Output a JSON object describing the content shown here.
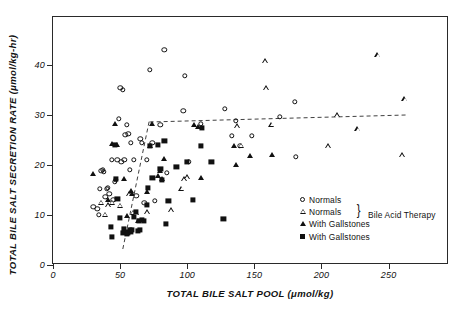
{
  "chart_data": {
    "type": "scatter",
    "title": "",
    "xlabel": "TOTAL BILE SALT POOL (μmol/kg)",
    "ylabel": "TOTAL BILE SALT SECRETION RATE (μmol/kg-hr)",
    "xlim": [
      0,
      295
    ],
    "ylim": [
      0,
      49.6
    ],
    "xticks": [
      0,
      50,
      100,
      150,
      200,
      250
    ],
    "yticks": [
      0,
      10,
      20,
      30,
      40
    ],
    "grid": false,
    "legend_position": "lower-right-inside",
    "legend": [
      {
        "marker": "open-circle",
        "label": "Normals"
      },
      {
        "marker": "open-triangle",
        "label": "Normals"
      },
      {
        "marker": "filled-triangle",
        "label": "With Gallstones"
      },
      {
        "marker": "filled-square",
        "label": "With Gallstones"
      }
    ],
    "annotations": [
      {
        "text": "Bile Acid Therapy",
        "brace_spans": [
          "open-triangle",
          "filled-triangle"
        ]
      }
    ],
    "fit_lines": [
      {
        "name": "steep-rising-dashed",
        "style": "dashed",
        "x": [
          52,
          72
        ],
        "y": [
          3.2,
          29.2
        ]
      },
      {
        "name": "plateau-dashed",
        "style": "dashed",
        "x": [
          72,
          263
        ],
        "y": [
          28.6,
          30.0
        ]
      }
    ],
    "series": [
      {
        "name": "Normals",
        "marker": "open-circle",
        "points": [
          [
            30,
            11.6
          ],
          [
            33,
            11.3
          ],
          [
            34,
            10.0
          ],
          [
            35,
            15.2
          ],
          [
            36,
            18.8
          ],
          [
            37,
            19.0
          ],
          [
            38,
            18.6
          ],
          [
            39,
            13.6
          ],
          [
            40,
            15.3
          ],
          [
            41,
            15.5
          ],
          [
            42,
            14.2
          ],
          [
            44,
            21.0
          ],
          [
            45,
            13.0
          ],
          [
            46,
            16.6
          ],
          [
            47,
            17.0
          ],
          [
            48,
            21.0
          ],
          [
            49,
            29.2
          ],
          [
            50,
            35.4
          ],
          [
            51,
            20.7
          ],
          [
            52,
            35.0
          ],
          [
            53,
            21.0
          ],
          [
            54,
            26.0
          ],
          [
            55,
            28.0
          ],
          [
            56,
            26.2
          ],
          [
            57,
            19.0
          ],
          [
            58,
            24.5
          ],
          [
            60,
            21.0
          ],
          [
            62,
            13.9
          ],
          [
            65,
            25.3
          ],
          [
            66,
            24.5
          ],
          [
            68,
            12.4
          ],
          [
            70,
            21.0
          ],
          [
            72,
            39.0
          ],
          [
            74,
            24.4
          ],
          [
            76,
            12.9
          ],
          [
            80,
            28.0
          ],
          [
            83,
            43.0
          ],
          [
            85,
            18.5
          ],
          [
            97,
            30.8
          ],
          [
            98,
            37.8
          ],
          [
            101,
            20.6
          ],
          [
            110,
            28.2
          ],
          [
            128,
            31.3
          ],
          [
            133,
            25.8
          ],
          [
            136,
            28.8
          ],
          [
            139,
            23.9
          ],
          [
            148,
            25.8
          ],
          [
            169,
            29.7
          ],
          [
            180,
            32.6
          ],
          [
            181,
            21.6
          ]
        ]
      },
      {
        "name": "Normals (Bile Acid Therapy)",
        "marker": "open-triangle",
        "points": [
          [
            36,
            12.5
          ],
          [
            39,
            10.1
          ],
          [
            41,
            12.0
          ],
          [
            44,
            12.5
          ],
          [
            50,
            11.9
          ],
          [
            57,
            14.2
          ],
          [
            60,
            10.5
          ],
          [
            62,
            10.4
          ],
          [
            70,
            10.6
          ],
          [
            88,
            11.0
          ],
          [
            96,
            15.3
          ],
          [
            98,
            17.2
          ],
          [
            100,
            17.6
          ],
          [
            137,
            27.8
          ],
          [
            140,
            23.9
          ],
          [
            158,
            40.8
          ],
          [
            159,
            35.4
          ],
          [
            163,
            28.1
          ],
          [
            205,
            23.8
          ],
          [
            212,
            30.0
          ],
          [
            227,
            27.2
          ],
          [
            242,
            42.0
          ],
          [
            260,
            22.0
          ],
          [
            262,
            33.2
          ]
        ]
      },
      {
        "name": "With Gallstones (Bile Acid Therapy)",
        "marker": "filled-triangle",
        "points": [
          [
            30,
            18.2
          ],
          [
            41,
            13.0
          ],
          [
            44,
            24.2
          ],
          [
            46,
            28.2
          ],
          [
            48,
            24.0
          ],
          [
            53,
            17.3
          ],
          [
            55,
            9.8
          ],
          [
            57,
            6.6
          ],
          [
            58,
            14.9
          ],
          [
            59,
            14.2
          ],
          [
            63,
            8.9
          ],
          [
            70,
            14.7
          ],
          [
            72,
            23.9
          ],
          [
            74,
            28.2
          ],
          [
            78,
            17.8
          ],
          [
            80,
            18.8
          ],
          [
            81,
            17.2
          ],
          [
            83,
            21.3
          ],
          [
            105,
            28.0
          ],
          [
            108,
            27.6
          ],
          [
            110,
            17.4
          ],
          [
            135,
            23.9
          ],
          [
            136,
            20.0
          ],
          [
            147,
            21.9
          ],
          [
            163,
            22.0
          ]
        ]
      },
      {
        "name": "With Gallstones",
        "marker": "filled-square",
        "points": [
          [
            43,
            7.7
          ],
          [
            44,
            5.6
          ],
          [
            46,
            24.0
          ],
          [
            47,
            17.2
          ],
          [
            48,
            13.2
          ],
          [
            50,
            9.4
          ],
          [
            52,
            6.4
          ],
          [
            53,
            7.3
          ],
          [
            54,
            6.7
          ],
          [
            55,
            6.3
          ],
          [
            56,
            6.5
          ],
          [
            57,
            7.0
          ],
          [
            58,
            6.6
          ],
          [
            59,
            7.1
          ],
          [
            60,
            9.6
          ],
          [
            62,
            10.6
          ],
          [
            63,
            6.9
          ],
          [
            64,
            8.9
          ],
          [
            65,
            7.0
          ],
          [
            66,
            9.0
          ],
          [
            68,
            8.8
          ],
          [
            70,
            12.1
          ],
          [
            71,
            15.5
          ],
          [
            72,
            23.8
          ],
          [
            74,
            17.5
          ],
          [
            78,
            24.0
          ],
          [
            80,
            19.2
          ],
          [
            81,
            17.0
          ],
          [
            83,
            24.9
          ],
          [
            84,
            8.2
          ],
          [
            86,
            12.9
          ],
          [
            92,
            19.7
          ],
          [
            100,
            20.6
          ],
          [
            104,
            13.0
          ],
          [
            110,
            23.8
          ],
          [
            111,
            27.5
          ],
          [
            118,
            20.7
          ],
          [
            127,
            9.2
          ]
        ]
      }
    ]
  }
}
